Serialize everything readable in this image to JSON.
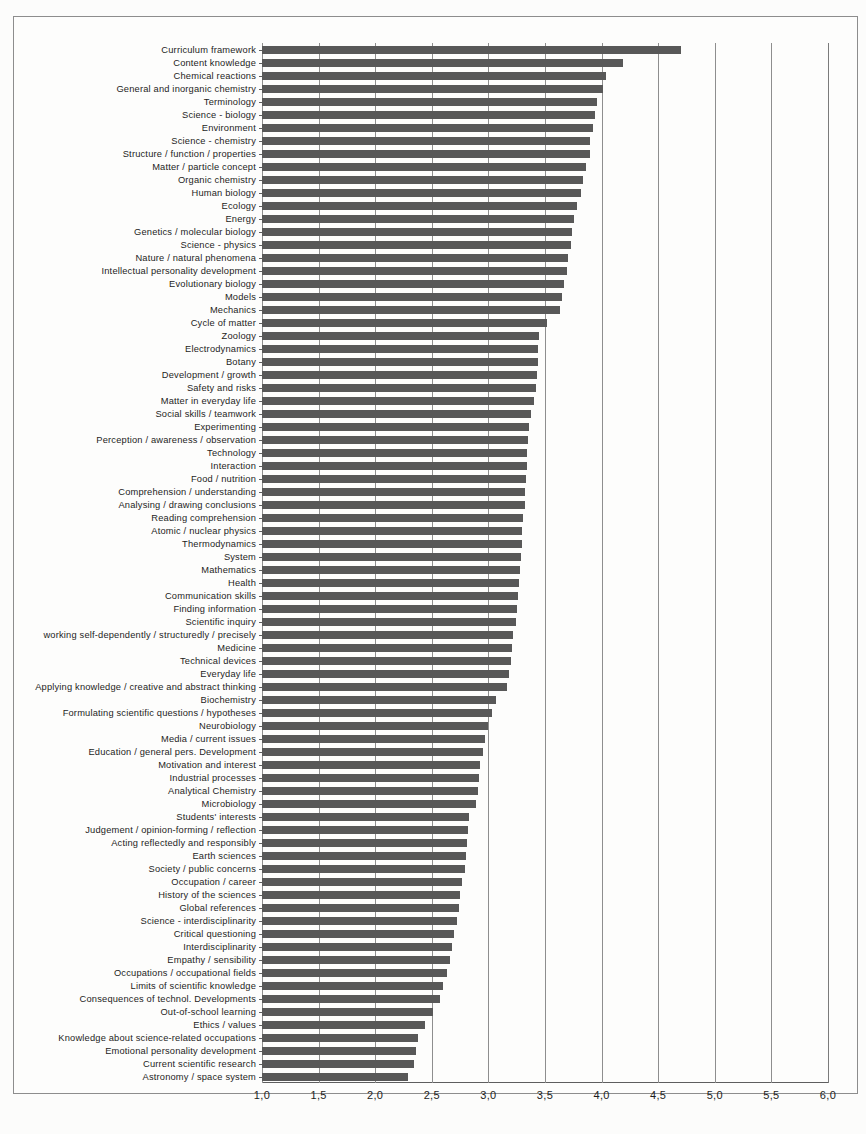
{
  "chart_data": {
    "type": "bar",
    "orientation": "horizontal",
    "title": "",
    "subtitle": "",
    "xlabel": "",
    "ylabel": "",
    "xlim": [
      1.0,
      6.0
    ],
    "grid": true,
    "legend": null,
    "tick_labels": [
      "1,0",
      "1,5",
      "2,0",
      "2,5",
      "3,0",
      "3,5",
      "4,0",
      "4,5",
      "5,0",
      "5,5",
      "6,0"
    ],
    "ticks": [
      1.0,
      1.5,
      2.0,
      2.5,
      3.0,
      3.5,
      4.0,
      4.5,
      5.0,
      5.5,
      6.0
    ],
    "decimal_separator": ",",
    "bar_color": "#585858",
    "categories": [
      "Curriculum framework",
      "Content knowledge",
      "Chemical reactions",
      "General and inorganic chemistry",
      "Terminology",
      "Science - biology",
      "Environment",
      "Science - chemistry",
      "Structure / function / properties",
      "Matter / particle concept",
      "Organic chemistry",
      "Human biology",
      "Ecology",
      "Energy",
      "Genetics / molecular biology",
      "Science - physics",
      "Nature / natural phenomena",
      "Intellectual personality development",
      "Evolutionary biology",
      "Models",
      "Mechanics",
      "Cycle of matter",
      "Zoology",
      "Electrodynamics",
      "Botany",
      "Development / growth",
      "Safety and risks",
      "Matter in everyday life",
      "Social skills / teamwork",
      "Experimenting",
      "Perception / awareness / observation",
      "Technology",
      "Interaction",
      "Food / nutrition",
      "Comprehension / understanding",
      "Analysing / drawing conclusions",
      "Reading comprehension",
      "Atomic / nuclear physics",
      "Thermodynamics",
      "System",
      "Mathematics",
      "Health",
      "Communication skills",
      "Finding information",
      "Scientific inquiry",
      "working self-dependently / structuredly / precisely",
      "Medicine",
      "Technical devices",
      "Everyday life",
      "Applying knowledge / creative and abstract thinking",
      "Biochemistry",
      "Formulating scientific questions / hypotheses",
      "Neurobiology",
      "Media / current issues",
      "Education / general pers. Development",
      "Motivation and interest",
      "Industrial processes",
      "Analytical Chemistry",
      "Microbiology",
      "Students' interests",
      "Judgement / opinion-forming / reflection",
      "Acting reflectedly and responsibly",
      "Earth sciences",
      "Society / public concerns",
      "Occupation / career",
      "History of the sciences",
      "Global references",
      "Science - interdisciplinarity",
      "Critical questioning",
      "Interdisciplinarity",
      "Empathy / sensibility",
      "Occupations / occupational fields",
      "Limits of scientific knowledge",
      "Consequences of technol. Developments",
      "Out-of-school learning",
      "Ethics / values",
      "Knowledge about science-related occupations",
      "Emotional personality development",
      "Current scientific research",
      "Astronomy / space system"
    ],
    "values": [
      4.7,
      4.19,
      4.04,
      4.01,
      3.96,
      3.94,
      3.92,
      3.9,
      3.9,
      3.86,
      3.84,
      3.82,
      3.78,
      3.76,
      3.74,
      3.73,
      3.7,
      3.69,
      3.67,
      3.65,
      3.63,
      3.52,
      3.45,
      3.44,
      3.44,
      3.43,
      3.42,
      3.4,
      3.38,
      3.36,
      3.35,
      3.34,
      3.34,
      3.33,
      3.32,
      3.32,
      3.31,
      3.3,
      3.3,
      3.29,
      3.28,
      3.27,
      3.26,
      3.25,
      3.24,
      3.22,
      3.21,
      3.2,
      3.18,
      3.16,
      3.07,
      3.03,
      3.0,
      2.97,
      2.95,
      2.93,
      2.92,
      2.91,
      2.89,
      2.83,
      2.82,
      2.81,
      2.8,
      2.79,
      2.77,
      2.75,
      2.74,
      2.72,
      2.7,
      2.68,
      2.66,
      2.63,
      2.6,
      2.57,
      2.51,
      2.44,
      2.38,
      2.36,
      2.34,
      2.29
    ]
  }
}
